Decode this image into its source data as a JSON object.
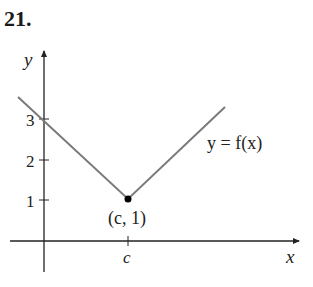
{
  "problem": {
    "number": "21."
  },
  "axes": {
    "x_label": "x",
    "y_label": "y"
  },
  "y_ticks": [
    {
      "label": "3",
      "value": 3
    },
    {
      "label": "2",
      "value": 2
    },
    {
      "label": "1",
      "value": 1
    }
  ],
  "x_ticks": [
    {
      "label": "c",
      "value": "c"
    }
  ],
  "curve": {
    "label": "y = f(x)",
    "type": "V-shaped (absolute value) piecewise linear",
    "color": "#7a7a7a"
  },
  "point": {
    "label": "(c, 1)",
    "x": "c",
    "y": 1
  },
  "colors": {
    "axis": "#222222",
    "curve": "#7a7a7a",
    "point": "#000000"
  }
}
